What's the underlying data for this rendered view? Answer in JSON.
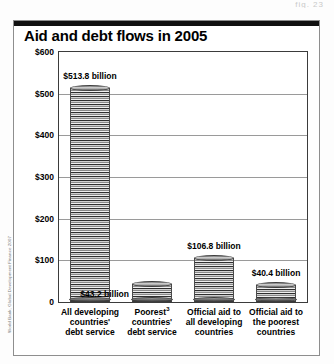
{
  "page": {
    "header_scrap": "fig. 23"
  },
  "figure": {
    "title": "Aid and debt flows in 2005",
    "source": "World Bank, Global Development Finance 2007"
  },
  "chart_data": {
    "type": "bar",
    "title": "Aid and debt flows in 2005",
    "xlabel": "",
    "ylabel": "",
    "ylim": [
      0,
      600
    ],
    "grid": true,
    "legend": "none",
    "yticks": [
      {
        "value": 600,
        "label": "$600"
      },
      {
        "value": 500,
        "label": "$500"
      },
      {
        "value": 400,
        "label": "$400"
      },
      {
        "value": 300,
        "label": "$300"
      },
      {
        "value": 200,
        "label": "$200"
      },
      {
        "value": 100,
        "label": "$100"
      },
      {
        "value": 0,
        "label": "0"
      }
    ],
    "categories": [
      "All developing countries' debt service",
      "Poorest³ countries' debt service",
      "Official aid to all developing countries",
      "Official aid to the poorest countries"
    ],
    "values": [
      513.8,
      43.2,
      106.8,
      40.4
    ],
    "data_labels": [
      "$513.8 billion",
      "$43.2 billion",
      "$106.8 billion",
      "$40.4 billion"
    ],
    "category_lines": [
      [
        "All developing",
        "countries'",
        "debt service"
      ],
      [
        "Poorest",
        "countries'",
        "debt service"
      ],
      [
        "Official aid to",
        "all developing",
        "countries"
      ],
      [
        "Official aid to",
        "the poorest",
        "countries"
      ]
    ],
    "footnote_markers": [
      "",
      "3",
      "",
      ""
    ]
  }
}
